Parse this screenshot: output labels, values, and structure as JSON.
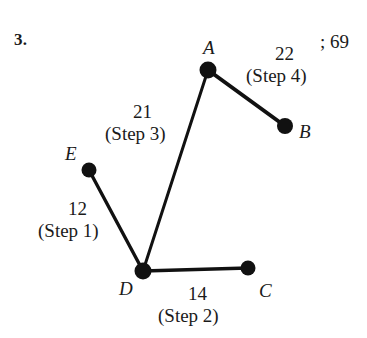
{
  "problem": {
    "number_label": "3.",
    "answer_note": "; 69"
  },
  "graph": {
    "nodes": [
      {
        "id": "A",
        "label": "A",
        "cx": 208,
        "cy": 70,
        "r": 8,
        "label_x": 203,
        "label_y": 38
      },
      {
        "id": "B",
        "label": "B",
        "cx": 285,
        "cy": 126,
        "r": 8,
        "label_x": 299,
        "label_y": 122
      },
      {
        "id": "C",
        "label": "C",
        "cx": 248,
        "cy": 268,
        "r": 7,
        "label_x": 259,
        "label_y": 281
      },
      {
        "id": "D",
        "label": "D",
        "cx": 143,
        "cy": 271,
        "r": 8,
        "label_x": 119,
        "label_y": 279
      },
      {
        "id": "E",
        "label": "E",
        "cx": 89,
        "cy": 170,
        "r": 7,
        "label_x": 65,
        "label_y": 144
      }
    ],
    "edges": [
      {
        "id": "ED",
        "from": "E",
        "to": "D",
        "weight": "12",
        "step": "(Step 1)",
        "weight_x": 78,
        "weight_y": 199,
        "step_x": 77,
        "step_y": 221
      },
      {
        "id": "DC",
        "from": "D",
        "to": "C",
        "weight": "14",
        "step": "(Step 2)",
        "weight_x": 198,
        "weight_y": 284,
        "step_x": 196,
        "step_y": 306
      },
      {
        "id": "DA",
        "from": "D",
        "to": "A",
        "weight": "21",
        "step": "(Step 3)",
        "weight_x": 143,
        "weight_y": 102,
        "step_x": 144,
        "step_y": 124
      },
      {
        "id": "AB",
        "from": "A",
        "to": "B",
        "weight": "22",
        "step": "(Step 4)",
        "weight_x": 285,
        "weight_y": 44,
        "step_x": 281,
        "step_y": 66
      }
    ],
    "colors": {
      "node_fill": "#111111",
      "edge_stroke": "#111111",
      "text": "#1a1a1a",
      "background": "#ffffff"
    }
  }
}
